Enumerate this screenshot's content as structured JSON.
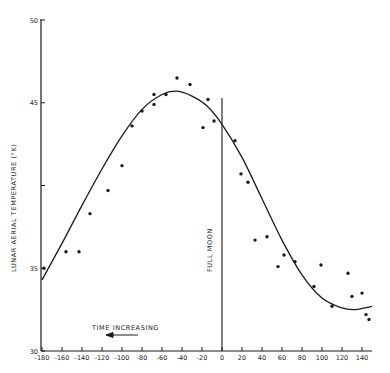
{
  "chart_data": {
    "type": "scatter",
    "title": "",
    "xlabel": "",
    "ylabel": "LUNAR AERIAL TEMPERATURE (°K)",
    "xlim": [
      -180,
      150
    ],
    "ylim": [
      30,
      50
    ],
    "xticks": [
      -180,
      -160,
      -140,
      -120,
      -100,
      -80,
      -60,
      -40,
      -20,
      0,
      20,
      40,
      60,
      80,
      100,
      120,
      140
    ],
    "yticks": [
      30,
      35,
      45,
      50
    ],
    "ytick_labels": [
      "30",
      "35",
      "45",
      "50"
    ],
    "yticks_missing_label": [
      40
    ],
    "grid": false,
    "legend": null,
    "annotations": [
      {
        "text": "FULL MOON",
        "x": 0,
        "orientation": "vertical",
        "marker": "vertical line at x=0"
      },
      {
        "text": "TIME INCREASING",
        "arrow": "left"
      }
    ],
    "series": [
      {
        "name": "observed",
        "kind": "points",
        "x": [
          -178,
          -156,
          -143,
          -132,
          -114,
          -100,
          -90,
          -80,
          -68,
          -68,
          -56,
          -45,
          -32,
          -19,
          -14,
          -8,
          13,
          19,
          26,
          33,
          45,
          56,
          62,
          73,
          92,
          99,
          110,
          126,
          130,
          140,
          144,
          147
        ],
        "y": [
          35.0,
          36.0,
          36.0,
          38.3,
          39.7,
          41.2,
          43.6,
          44.5,
          44.9,
          45.5,
          45.5,
          46.5,
          46.1,
          43.5,
          45.2,
          43.9,
          42.7,
          40.7,
          40.2,
          36.7,
          36.9,
          35.1,
          35.8,
          35.4,
          33.9,
          35.2,
          32.7,
          34.7,
          33.3,
          33.5,
          32.2,
          31.9
        ]
      },
      {
        "name": "fitted curve",
        "kind": "line",
        "x": [
          -180,
          -160,
          -140,
          -120,
          -100,
          -80,
          -60,
          -45,
          -30,
          -15,
          0,
          20,
          40,
          60,
          80,
          100,
          120,
          133,
          150
        ],
        "y": [
          34.3,
          36.5,
          38.8,
          41.0,
          43.0,
          44.6,
          45.5,
          45.7,
          45.4,
          44.8,
          43.7,
          41.7,
          39.2,
          36.7,
          34.6,
          33.2,
          32.6,
          32.5,
          32.7
        ]
      }
    ]
  },
  "labels": {
    "y_axis_title": "LUNAR   AERIAL   TEMPERATURE  (°K)",
    "full_moon": "FULL MOON",
    "time_increasing": "TIME INCREASING",
    "arrow": "⟵"
  },
  "style": {
    "ink": "#1a1a1a",
    "background": "#ffffff"
  }
}
